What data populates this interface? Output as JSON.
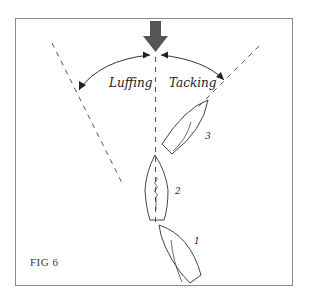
{
  "figure": {
    "label": "FIG 6",
    "wind_arrow": {
      "direction": "down",
      "color": "#555555"
    },
    "zones": [
      {
        "name": "luffing",
        "label": "Luffing"
      },
      {
        "name": "tacking",
        "label": "Tacking"
      }
    ],
    "boats": [
      {
        "id": "boat-1",
        "label": "1"
      },
      {
        "id": "boat-2",
        "label": "2"
      },
      {
        "id": "boat-3",
        "label": "3"
      }
    ],
    "colors": {
      "line": "#444444",
      "dash": "#555555",
      "frame": "#8a8a8a"
    }
  }
}
